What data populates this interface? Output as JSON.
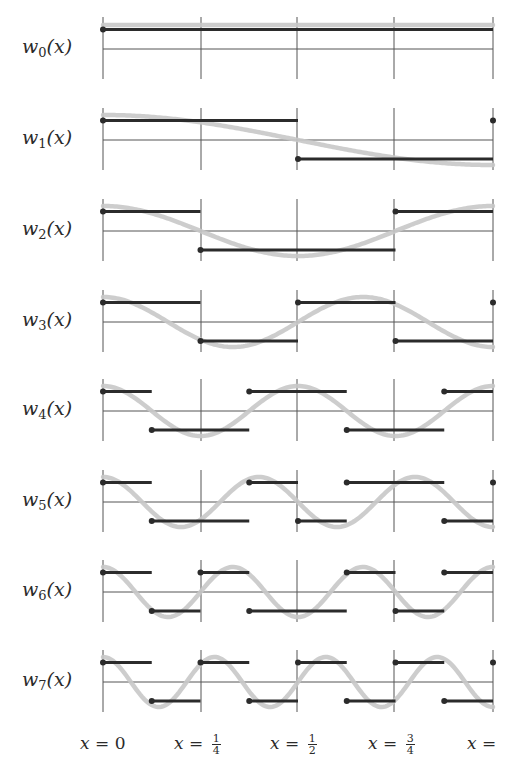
{
  "figure": {
    "colors": {
      "grid": "#555555",
      "step": "#2b2b2b",
      "sinusoid": "#c8c8c8",
      "text": "#2a2a2a"
    },
    "gridlines_x_px": [
      103,
      201,
      297,
      394,
      493
    ],
    "panel_tops_px": [
      17,
      108,
      199,
      290,
      379,
      470,
      560,
      650
    ]
  },
  "rows": [
    {
      "name": "w",
      "sub": "0",
      "label_suffix": "(x)",
      "signs": [
        1,
        1,
        1,
        1,
        1,
        1,
        1,
        1
      ],
      "end_dot": false,
      "sinusoid": {
        "type": "const"
      }
    },
    {
      "name": "w",
      "sub": "1",
      "label_suffix": "(x)",
      "signs": [
        1,
        1,
        1,
        1,
        -1,
        -1,
        -1,
        -1
      ],
      "end_dot": true,
      "sinusoid": {
        "type": "cos",
        "freq": 0.5
      }
    },
    {
      "name": "w",
      "sub": "2",
      "label_suffix": "(x)",
      "signs": [
        1,
        1,
        -1,
        -1,
        -1,
        -1,
        1,
        1
      ],
      "end_dot": false,
      "sinusoid": {
        "type": "cos",
        "freq": 1
      }
    },
    {
      "name": "w",
      "sub": "3",
      "label_suffix": "(x)",
      "signs": [
        1,
        1,
        -1,
        -1,
        1,
        1,
        -1,
        -1
      ],
      "end_dot": true,
      "sinusoid": {
        "type": "cos",
        "freq": 1.5
      }
    },
    {
      "name": "w",
      "sub": "4",
      "label_suffix": "(x)",
      "signs": [
        1,
        -1,
        -1,
        1,
        1,
        -1,
        -1,
        1
      ],
      "end_dot": false,
      "sinusoid": {
        "type": "cos",
        "freq": 2
      }
    },
    {
      "name": "w",
      "sub": "5",
      "label_suffix": "(x)",
      "signs": [
        1,
        -1,
        -1,
        1,
        -1,
        1,
        1,
        -1
      ],
      "end_dot": true,
      "sinusoid": {
        "type": "cos",
        "freq": 2.5
      }
    },
    {
      "name": "w",
      "sub": "6",
      "label_suffix": "(x)",
      "signs": [
        1,
        -1,
        1,
        -1,
        -1,
        1,
        -1,
        1
      ],
      "end_dot": false,
      "sinusoid": {
        "type": "cos",
        "freq": 3
      }
    },
    {
      "name": "w",
      "sub": "7",
      "label_suffix": "(x)",
      "signs": [
        1,
        -1,
        1,
        -1,
        1,
        -1,
        1,
        -1
      ],
      "end_dot": true,
      "sinusoid": {
        "type": "cos",
        "freq": 3.5
      }
    }
  ],
  "x_axis": {
    "labels": [
      {
        "var": "x",
        "eq": " = ",
        "value": "0",
        "frac": null,
        "left": 80
      },
      {
        "var": "x",
        "eq": " = ",
        "value": "",
        "frac": {
          "num": "1",
          "den": "4"
        },
        "left": 174
      },
      {
        "var": "x",
        "eq": " = ",
        "value": "",
        "frac": {
          "num": "1",
          "den": "2"
        },
        "left": 270
      },
      {
        "var": "x",
        "eq": " = ",
        "value": "",
        "frac": {
          "num": "3",
          "den": "4"
        },
        "left": 368
      },
      {
        "var": "x",
        "eq": " =",
        "value": "",
        "frac": null,
        "left": 467
      }
    ]
  }
}
